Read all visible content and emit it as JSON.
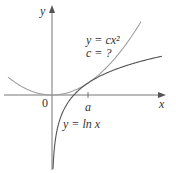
{
  "diagram": {
    "axes": {
      "x_label": "x",
      "y_label": "y",
      "origin_label": "0",
      "tick_label": "a"
    },
    "curves": [
      {
        "name": "parabola",
        "equation_label": "y = cx²",
        "param_label": "c = ?",
        "color": "#9a9a9a"
      },
      {
        "name": "natural-log",
        "equation_label": "y = ln x",
        "color": "#555555"
      }
    ],
    "colors": {
      "axis": "#555555",
      "text": "#333333",
      "background": "#ffffff"
    }
  }
}
